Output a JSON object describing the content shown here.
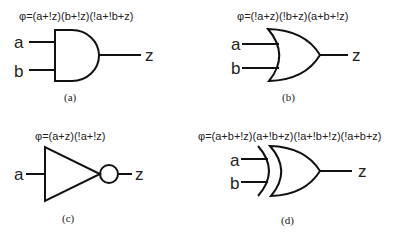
{
  "panels": [
    {
      "id": "a",
      "gate": "AND",
      "formula": "φ=(a+!z)(b+!z)(!a+!b+z)",
      "inputs": [
        "a",
        "b"
      ],
      "output": "z",
      "caption": "(a)"
    },
    {
      "id": "b",
      "gate": "OR",
      "formula": "φ=(!a+z)(!b+z)(a+b+!z)",
      "inputs": [
        "a",
        "b"
      ],
      "output": "z",
      "caption": "(b)"
    },
    {
      "id": "c",
      "gate": "NOT",
      "formula": "φ=(a+z)(!a+!z)",
      "inputs": [
        "a"
      ],
      "output": "z",
      "caption": "(c)"
    },
    {
      "id": "d",
      "gate": "XOR",
      "formula": "φ=(a+b+!z)(a+!b+z)(!a+!b+!z)(!a+b+z)",
      "inputs": [
        "a",
        "b"
      ],
      "output": "z",
      "caption": "(d)"
    }
  ],
  "colors": {
    "line": "#111111",
    "text": "#222222",
    "background": "#ffffff"
  }
}
